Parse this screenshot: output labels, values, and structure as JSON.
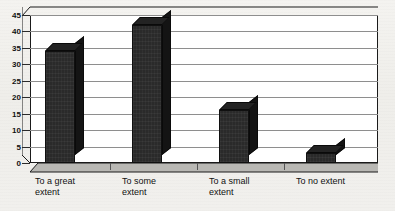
{
  "chart_data": {
    "type": "bar",
    "title": "",
    "subtitle": "",
    "xlabel": "",
    "ylabel": "",
    "categories": [
      "To a great extent",
      "To some extent",
      "To a small extent",
      "To no extent"
    ],
    "values": [
      34,
      42,
      16,
      3
    ],
    "series": [
      {
        "name": "",
        "values": [
          34,
          42,
          16,
          3
        ]
      }
    ],
    "ylim": [
      0,
      45
    ],
    "ytick_step": 5,
    "yticks": [
      0,
      5,
      10,
      15,
      20,
      25,
      30,
      35,
      40,
      45
    ],
    "ytick_labels": [
      "0",
      "5",
      "10",
      "15",
      "20",
      "25",
      "30",
      "35",
      "40",
      "45"
    ],
    "grid": true,
    "grid_axis": "y",
    "legend": false,
    "legend_position": "none",
    "style": "3d-column",
    "bar_color": "#2a2a2a",
    "bar_side_color": "#141414",
    "bar_top_color": "#232323",
    "plot_background": "#ffffff",
    "gridline_color": "#8e8e8e",
    "axis_color": "#1a1a1a",
    "figure_background": "#f1f0ed"
  },
  "axes": {
    "y": {
      "ticks": [
        {
          "value": 45,
          "label": "45"
        },
        {
          "value": 40,
          "label": "40"
        },
        {
          "value": 35,
          "label": "35"
        },
        {
          "value": 30,
          "label": "30"
        },
        {
          "value": 25,
          "label": "25"
        },
        {
          "value": 20,
          "label": "20"
        },
        {
          "value": 15,
          "label": "15"
        },
        {
          "value": 10,
          "label": "10"
        },
        {
          "value": 5,
          "label": "5"
        },
        {
          "value": 0,
          "label": "0"
        }
      ]
    },
    "x": {
      "ticks": [
        {
          "label_line1": "To a great",
          "label_line2": "extent"
        },
        {
          "label_line1": "To some",
          "label_line2": "extent"
        },
        {
          "label_line1": "To a small",
          "label_line2": "extent"
        },
        {
          "label_line1": "To no extent",
          "label_line2": ""
        }
      ]
    }
  }
}
